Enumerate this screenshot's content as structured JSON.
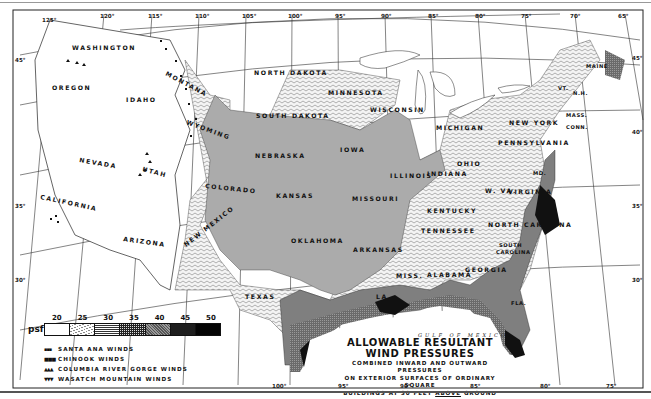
{
  "map": {
    "title_line1": "ALLOWABLE RESULTANT",
    "title_line2": "WIND PRESSURES",
    "subtitle_line1": "COMBINED INWARD AND OUTWARD PRESSURES",
    "subtitle_line2": "ON EXTERIOR SURFACES OF ORDINARY SQUARE",
    "subtitle_line3_a": "BUILDINGS AT 30 FEET",
    "subtitle_line3_b": "ABOVE",
    "subtitle_line3_c": "GROUND",
    "water_label": "GULF OF MEXICO"
  },
  "legend": {
    "unit": "psf",
    "values": [
      "20",
      "25",
      "30",
      "35",
      "40",
      "45",
      "50"
    ],
    "fills": [
      "#ffffff",
      "#e4e4e4",
      "#c9c9c9",
      "#a9a9a9",
      "#7d7d7d",
      "#262626",
      "#0a0a0a"
    ],
    "wind_types": [
      {
        "symbol": "▪▪▪",
        "label": "SANTA ANA WINDS"
      },
      {
        "symbol": "■■■",
        "label": "CHINOOK WINDS"
      },
      {
        "symbol": "▲▲▲",
        "label": "COLUMBIA RIVER GORGE WINDS"
      },
      {
        "symbol": "▼▼▼",
        "label": "WASATCH MOUNTAIN WINDS"
      }
    ]
  },
  "longitude_ticks_top": [
    "125°",
    "120°",
    "115°",
    "110°",
    "105°",
    "100°",
    "95°",
    "90°",
    "85°",
    "80°",
    "75°",
    "70°",
    "65°"
  ],
  "longitude_ticks_bottom": [
    "100°",
    "95°",
    "90°",
    "85°",
    "80°",
    "75°"
  ],
  "latitude_ticks_left": [
    "45°",
    "35°",
    "30°"
  ],
  "latitude_ticks_right": [
    "45°",
    "40°",
    "35°",
    "30°"
  ],
  "states": {
    "washington": "WASHINGTON",
    "oregon": "OREGON",
    "idaho": "IDAHO",
    "montana": "MONTANA",
    "wyoming": "WYOMING",
    "nevada": "NEVADA",
    "utah": "UTAH",
    "california": "CALIFORNIA",
    "arizona": "ARIZONA",
    "colorado": "COLORADO",
    "new_mexico": "NEW MEXICO",
    "north_dakota": "NORTH DAKOTA",
    "south_dakota": "SOUTH DAKOTA",
    "nebraska": "NEBRASKA",
    "kansas": "KANSAS",
    "oklahoma": "OKLAHOMA",
    "texas": "TEXAS",
    "minnesota": "MINNESOTA",
    "iowa": "IOWA",
    "missouri": "MISSOURI",
    "arkansas": "ARKANSAS",
    "louisiana": "LA.",
    "wisconsin": "WISCONSIN",
    "illinois": "ILLINOIS",
    "indiana": "INDIANA",
    "michigan": "MICHIGAN",
    "ohio": "OHIO",
    "kentucky": "KENTUCKY",
    "tennessee": "TENNESSEE",
    "mississippi": "MISS.",
    "alabama": "ALABAMA",
    "georgia": "GEORGIA",
    "florida": "FLA.",
    "south_carolina_1": "SOUTH",
    "south_carolina_2": "CAROLINA",
    "north_carolina": "NORTH CAROLINA",
    "virginia": "VIRGINIA",
    "west_virginia": "W. VA.",
    "pennsylvania": "PENNSYLVANIA",
    "new_york": "NEW YORK",
    "maryland": "MD.",
    "vermont": "VT.",
    "new_hampshire": "N.H.",
    "maine": "MAINE",
    "massachusetts": "MASS.",
    "connecticut": "CONN."
  }
}
